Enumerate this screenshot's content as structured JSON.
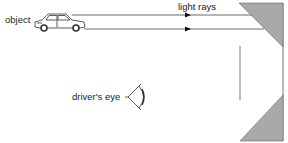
{
  "diagram": {
    "labels": {
      "object": "object",
      "light_rays": "light rays",
      "drivers_eye": "driver's eye"
    },
    "icons": {
      "object": "car-icon",
      "viewer": "eye-icon",
      "direction": "arrowhead-icon"
    },
    "colors": {
      "line": "#333333",
      "mirror_fill": "#a9a9a9",
      "background": "#ffffff",
      "text": "#222222"
    }
  }
}
